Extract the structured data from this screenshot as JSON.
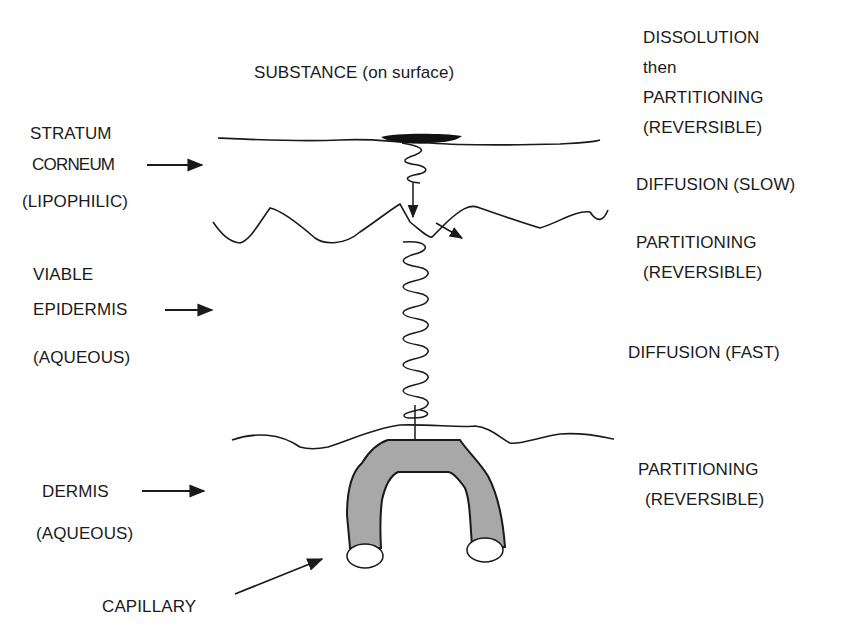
{
  "title": "SUBSTANCE (on surface)",
  "layers": [
    {
      "id": "stratum-corneum",
      "name_lines": [
        "STRATUM",
        "CORNEUM"
      ],
      "property": "(LIPOPHILIC)"
    },
    {
      "id": "viable-epidermis",
      "name_lines": [
        "VIABLE",
        "EPIDERMIS"
      ],
      "property": "(AQUEOUS)"
    },
    {
      "id": "dermis",
      "name_lines": [
        "DERMIS"
      ],
      "property": "(AQUEOUS)"
    }
  ],
  "structure_labels": {
    "capillary": "CAPILLARY"
  },
  "processes": [
    {
      "lines": [
        "DISSOLUTION",
        "then",
        "PARTITIONING",
        "(REVERSIBLE)"
      ]
    },
    {
      "lines": [
        "DIFFUSION (SLOW)"
      ]
    },
    {
      "lines": [
        "PARTITIONING",
        "(REVERSIBLE)"
      ]
    },
    {
      "lines": [
        "DIFFUSION (FAST)"
      ]
    },
    {
      "lines": [
        "PARTITIONING",
        "(REVERSIBLE)"
      ]
    }
  ],
  "colors": {
    "line": "#1a1a1a",
    "capillary_fill": "#a8a8a8"
  }
}
